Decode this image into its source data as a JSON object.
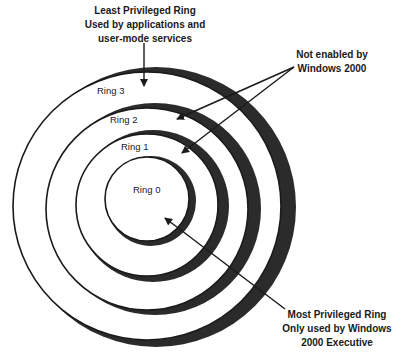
{
  "diagram": {
    "rings": [
      {
        "id": "ring-3",
        "label": "Ring 3"
      },
      {
        "id": "ring-2",
        "label": "Ring 2"
      },
      {
        "id": "ring-1",
        "label": "Ring 1"
      },
      {
        "id": "ring-0",
        "label": "Ring 0"
      }
    ],
    "callouts": {
      "least": {
        "line1": "Least Privileged Ring",
        "line2": "Used by applications and",
        "line3": "user-mode services"
      },
      "not_enabled": {
        "line1": "Not enabled by",
        "line2": "Windows 2000"
      },
      "most": {
        "line1": "Most Privileged Ring",
        "line2": "Only used by Windows",
        "line3": "2000 Executive"
      }
    },
    "colors": {
      "stroke": "#1a1a1a",
      "shadow": "#2b2b2b",
      "fill": "#ffffff"
    }
  }
}
